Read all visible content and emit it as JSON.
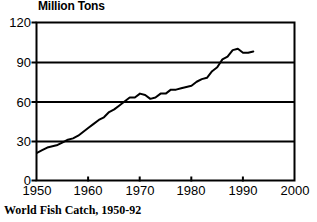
{
  "chart_data": {
    "type": "line",
    "title": "Million Tons",
    "caption": "World Fish Catch, 1950-92",
    "xlabel": "",
    "ylabel": "Million Tons",
    "xlim": [
      1950,
      2000
    ],
    "ylim": [
      0,
      120
    ],
    "grid": true,
    "legend": null,
    "yticks": [
      0,
      30,
      60,
      90,
      120
    ],
    "ytick_labels": [
      "0",
      "30",
      "60",
      "90",
      "120"
    ],
    "xticks": [
      1950,
      1960,
      1970,
      1980,
      1990,
      2000
    ],
    "xtick_labels": [
      "1950",
      "1960",
      "1970",
      "1980",
      "1990",
      "2000"
    ],
    "series": [
      {
        "name": "World Fish Catch",
        "color": "#000000",
        "x": [
          1950,
          1951,
          1952,
          1953,
          1954,
          1955,
          1956,
          1957,
          1958,
          1959,
          1960,
          1961,
          1962,
          1963,
          1964,
          1965,
          1966,
          1967,
          1968,
          1969,
          1970,
          1971,
          1972,
          1973,
          1974,
          1975,
          1976,
          1977,
          1978,
          1979,
          1980,
          1981,
          1982,
          1983,
          1984,
          1985,
          1986,
          1987,
          1988,
          1989,
          1990,
          1991,
          1992
        ],
        "values": [
          21,
          23,
          25,
          26,
          27,
          29,
          31,
          32,
          34,
          37,
          40,
          43,
          46,
          48,
          52,
          54,
          57,
          60,
          63,
          63,
          66,
          65,
          62,
          63,
          66,
          66,
          69,
          69,
          70,
          71,
          72,
          75,
          77,
          78,
          83,
          86,
          92,
          94,
          99,
          100,
          97,
          97,
          98
        ]
      }
    ]
  }
}
